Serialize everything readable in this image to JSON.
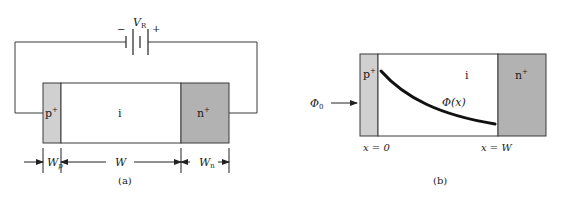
{
  "figure_a": {
    "caption": "(a)",
    "battery": {
      "label": "V",
      "label_subscript": "R",
      "minus": "−",
      "plus": "+"
    },
    "regions": {
      "p": {
        "label": "p",
        "sup": "+",
        "color": "#d0d0d0"
      },
      "i": {
        "label": "i",
        "color": "#ffffff"
      },
      "n": {
        "label": "n",
        "sup": "+",
        "color": "#b2b2b2"
      }
    },
    "dimensions": {
      "wp": {
        "label": "W",
        "sub": "p"
      },
      "w": {
        "label": "W"
      },
      "wn": {
        "label": "W",
        "sub": "n"
      }
    }
  },
  "figure_b": {
    "caption": "(b)",
    "incident_flux": {
      "label": "Φ",
      "sub": "0"
    },
    "curve_label": "Φ(x)",
    "regions": {
      "p": {
        "label": "p",
        "sup": "+",
        "color": "#d0d0d0"
      },
      "i": {
        "label": "i",
        "color": "#ffffff"
      },
      "n": {
        "label": "n",
        "sup": "+",
        "color": "#b2b2b2"
      }
    },
    "x_labels": {
      "start": "x = 0",
      "end": "x = W"
    }
  },
  "colors": {
    "stroke": "#3a3a3a",
    "curve": "#111111",
    "p_region": "#d0d0d0",
    "n_region": "#b2b2b2"
  }
}
